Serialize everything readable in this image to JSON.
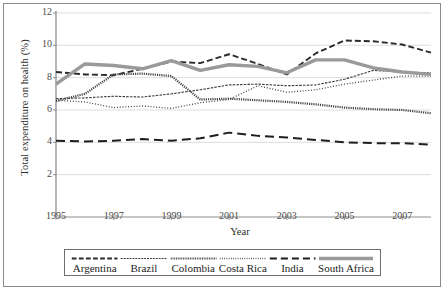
{
  "chart_data": {
    "type": "line",
    "title": "",
    "xlabel": "Year",
    "ylabel": "Total expenditure on health (%)",
    "xlim": [
      1995,
      2008
    ],
    "ylim": [
      0,
      12
    ],
    "ytick_labels": [
      "12",
      "10",
      "8",
      "6",
      "4",
      "2"
    ],
    "yticks": [
      12,
      10,
      8,
      6,
      4,
      2
    ],
    "xtick_labels": [
      "1995",
      "1997",
      "1999",
      "2001",
      "2003",
      "2005",
      "2007"
    ],
    "xticks": [
      1995,
      1997,
      1999,
      2001,
      2003,
      2005,
      2007
    ],
    "grid": true,
    "legend_position": "below",
    "x": [
      1995,
      1996,
      1997,
      1998,
      1999,
      2000,
      2001,
      2002,
      2003,
      2004,
      2005,
      2006,
      2007,
      2008
    ],
    "series": [
      {
        "name": "Argentina",
        "style": "dashed",
        "color": "#2b2b2b",
        "width": 1.9,
        "dash": "6,3",
        "values": [
          8.35,
          8.2,
          8.15,
          8.55,
          9.0,
          8.9,
          9.45,
          8.85,
          8.2,
          9.5,
          10.3,
          10.25,
          10.05,
          9.55
        ]
      },
      {
        "name": "Brazil",
        "style": "dash-fine",
        "color": "#3a3a3a",
        "width": 1.1,
        "dash": "2.5,1.2",
        "values": [
          6.7,
          6.75,
          6.85,
          6.8,
          7.0,
          7.25,
          7.55,
          7.6,
          7.5,
          7.55,
          7.9,
          8.45,
          8.35,
          8.3
        ]
      },
      {
        "name": "Colombia",
        "style": "beaded",
        "color": "#4a4a4a",
        "width": 2.2,
        "dash": "1.2,1.0",
        "values": [
          6.55,
          7.0,
          8.2,
          8.25,
          8.1,
          6.65,
          6.7,
          6.6,
          6.5,
          6.35,
          6.15,
          6.05,
          6.0,
          5.8
        ]
      },
      {
        "name": "Costa Rica",
        "style": "dotted",
        "color": "#333333",
        "width": 1.3,
        "dash": "0.9,1.9",
        "values": [
          6.6,
          6.5,
          6.15,
          6.25,
          6.1,
          6.45,
          6.65,
          7.5,
          7.1,
          7.25,
          7.6,
          7.85,
          8.1,
          8.1
        ]
      },
      {
        "name": "India",
        "style": "long-dash",
        "color": "#1f1f1f",
        "width": 2.0,
        "dash": "9,5",
        "values": [
          4.1,
          4.05,
          4.1,
          4.2,
          4.1,
          4.25,
          4.6,
          4.4,
          4.3,
          4.15,
          4.0,
          3.95,
          3.95,
          3.85
        ]
      },
      {
        "name": "South Africa",
        "style": "solid-thick",
        "color": "#9a9a9a",
        "width": 3.4,
        "dash": "",
        "values": [
          7.6,
          8.85,
          8.75,
          8.55,
          9.05,
          8.45,
          8.8,
          8.7,
          8.3,
          9.1,
          9.1,
          8.6,
          8.35,
          8.2
        ]
      }
    ]
  },
  "legend": {
    "items": [
      {
        "label": "Argentina"
      },
      {
        "label": "Brazil"
      },
      {
        "label": "Colombia"
      },
      {
        "label": "Costa Rica"
      },
      {
        "label": "India"
      },
      {
        "label": "South Africa"
      }
    ]
  }
}
